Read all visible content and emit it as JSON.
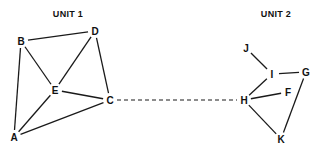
{
  "figure": {
    "background_color": "#ffffff",
    "stroke_color": "#1a1a1a",
    "label_color": "#111111"
  },
  "titles": [
    {
      "id": "unit1",
      "label": "UNIT 1",
      "x": 68,
      "y": 14
    },
    {
      "id": "unit2",
      "label": "UNIT 2",
      "x": 276,
      "y": 14
    }
  ],
  "chart_data": {
    "type": "diagram",
    "title": "",
    "subtitle": "",
    "layout": "two node clusters joined by a single dashed bridge edge",
    "groups": [
      {
        "id": "unit1",
        "label": "UNIT 1",
        "nodes": [
          "A",
          "B",
          "C",
          "D",
          "E"
        ]
      },
      {
        "id": "unit2",
        "label": "UNIT 2",
        "nodes": [
          "F",
          "G",
          "H",
          "I",
          "J",
          "K"
        ]
      }
    ],
    "nodes": [
      {
        "id": "B",
        "label": "B",
        "x": 21,
        "y": 41,
        "group": "unit1"
      },
      {
        "id": "D",
        "label": "D",
        "x": 95,
        "y": 31,
        "group": "unit1"
      },
      {
        "id": "E",
        "label": "E",
        "x": 55,
        "y": 90,
        "group": "unit1"
      },
      {
        "id": "C",
        "label": "C",
        "x": 110,
        "y": 100,
        "group": "unit1"
      },
      {
        "id": "A",
        "label": "A",
        "x": 14,
        "y": 137,
        "group": "unit1"
      },
      {
        "id": "J",
        "label": "J",
        "x": 246,
        "y": 48,
        "group": "unit2"
      },
      {
        "id": "I",
        "label": "I",
        "x": 272,
        "y": 74,
        "group": "unit2"
      },
      {
        "id": "G",
        "label": "G",
        "x": 306,
        "y": 72,
        "group": "unit2"
      },
      {
        "id": "H",
        "label": "H",
        "x": 244,
        "y": 100,
        "group": "unit2"
      },
      {
        "id": "F",
        "label": "F",
        "x": 288,
        "y": 92,
        "group": "unit2"
      },
      {
        "id": "K",
        "label": "K",
        "x": 281,
        "y": 139,
        "group": "unit2"
      }
    ],
    "edges": [
      {
        "from": "B",
        "to": "D",
        "style": "solid"
      },
      {
        "from": "B",
        "to": "A",
        "style": "solid"
      },
      {
        "from": "B",
        "to": "E",
        "style": "solid"
      },
      {
        "from": "D",
        "to": "E",
        "style": "solid"
      },
      {
        "from": "D",
        "to": "C",
        "style": "solid"
      },
      {
        "from": "E",
        "to": "C",
        "style": "solid"
      },
      {
        "from": "E",
        "to": "A",
        "style": "solid"
      },
      {
        "from": "A",
        "to": "C",
        "style": "solid"
      },
      {
        "from": "J",
        "to": "I",
        "style": "solid"
      },
      {
        "from": "I",
        "to": "G",
        "style": "solid"
      },
      {
        "from": "I",
        "to": "H",
        "style": "solid"
      },
      {
        "from": "H",
        "to": "F",
        "style": "solid"
      },
      {
        "from": "H",
        "to": "K",
        "style": "solid"
      },
      {
        "from": "G",
        "to": "K",
        "style": "solid"
      },
      {
        "from": "C",
        "to": "H",
        "style": "dashed"
      }
    ]
  }
}
